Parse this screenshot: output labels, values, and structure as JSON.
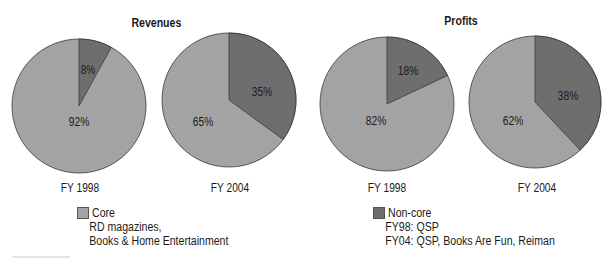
{
  "colors": {
    "core": "#a3a3a3",
    "noncore": "#6e6e6e",
    "outline": "#3a3a3a"
  },
  "titles": {
    "revenues": "Revenues",
    "profits": "Profits"
  },
  "pies": [
    {
      "label": "FY 1998",
      "group": "Revenues",
      "noncore": 8,
      "core": 92,
      "noncore_label": "8%",
      "core_label": "92%"
    },
    {
      "label": "FY 2004",
      "group": "Revenues",
      "noncore": 35,
      "core": 65,
      "noncore_label": "35%",
      "core_label": "65%"
    },
    {
      "label": "FY 1998",
      "group": "Profits",
      "noncore": 18,
      "core": 82,
      "noncore_label": "18%",
      "core_label": "82%"
    },
    {
      "label": "FY 2004",
      "group": "Profits",
      "noncore": 38,
      "core": 62,
      "noncore_label": "38%",
      "core_label": "62%"
    }
  ],
  "legend": {
    "core": {
      "label": "Core",
      "lines": [
        "RD magazines,",
        "Books & Home Entertainment"
      ]
    },
    "noncore": {
      "label": "Non-core",
      "lines": [
        "FY98: QSP",
        "FY04: QSP, Books Are Fun, Reiman"
      ]
    }
  },
  "chart_data": [
    {
      "type": "pie",
      "title": "Revenues",
      "subtitle": "FY 1998",
      "categories": [
        "Non-core",
        "Core"
      ],
      "values": [
        8,
        92
      ],
      "legend_position": "bottom"
    },
    {
      "type": "pie",
      "title": "Revenues",
      "subtitle": "FY 2004",
      "categories": [
        "Non-core",
        "Core"
      ],
      "values": [
        35,
        65
      ],
      "legend_position": "bottom"
    },
    {
      "type": "pie",
      "title": "Profits",
      "subtitle": "FY 1998",
      "categories": [
        "Non-core",
        "Core"
      ],
      "values": [
        18,
        82
      ],
      "legend_position": "bottom"
    },
    {
      "type": "pie",
      "title": "Profits",
      "subtitle": "FY 2004",
      "categories": [
        "Non-core",
        "Core"
      ],
      "values": [
        38,
        62
      ],
      "legend_position": "bottom"
    }
  ]
}
